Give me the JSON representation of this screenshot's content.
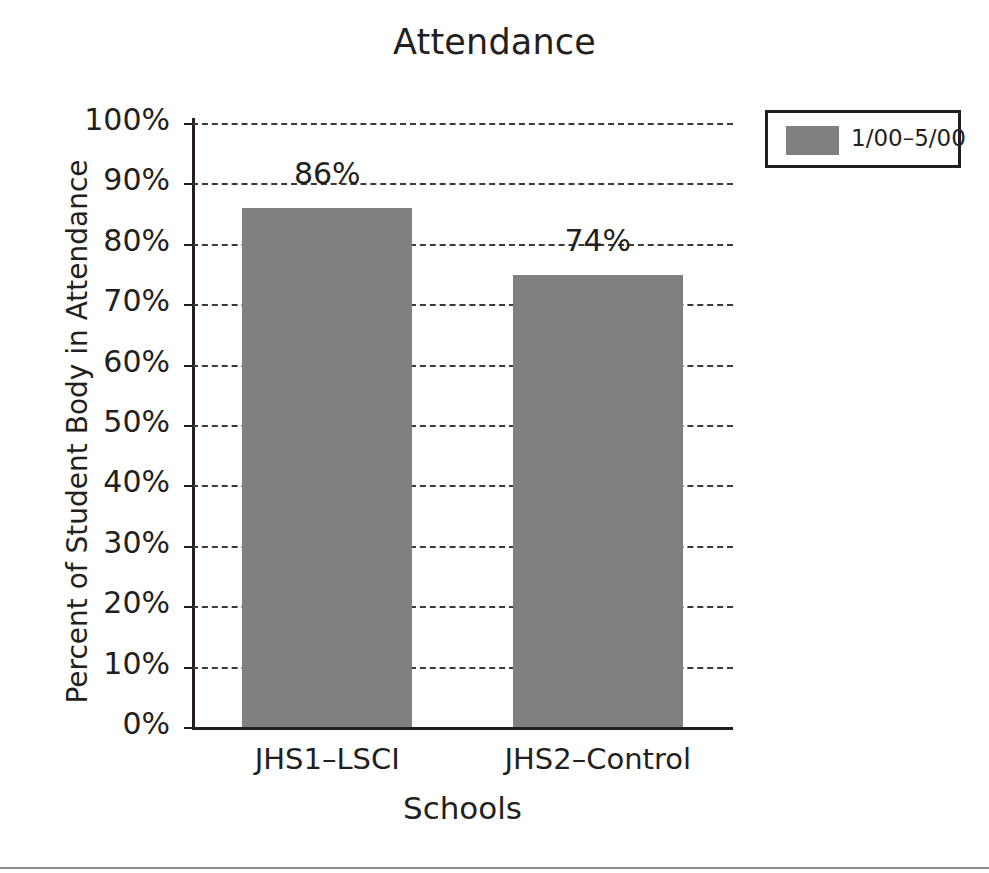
{
  "chart_data": {
    "type": "bar",
    "title": "Attendance",
    "xlabel": "Schools",
    "ylabel": "Percent of Student Body in Attendance",
    "categories": [
      "JHS1–LSCI",
      "JHS2–Control"
    ],
    "values": [
      86,
      74
    ],
    "bar_pixel_values": [
      85.9,
      74.8
    ],
    "data_labels": [
      "86%",
      "74%"
    ],
    "ylim": [
      0,
      100
    ],
    "ytick_values": [
      0,
      10,
      20,
      30,
      40,
      50,
      60,
      70,
      80,
      90,
      100
    ],
    "ytick_labels": [
      "0%",
      "10%",
      "20%",
      "30%",
      "40%",
      "50%",
      "60%",
      "70%",
      "80%",
      "90%",
      "100%"
    ],
    "grid": "horizontal-dashed",
    "legend_position": "top-right",
    "series": [
      {
        "name": "1/00–5/00",
        "values": [
          86,
          74
        ],
        "color": "#808080"
      }
    ],
    "legend": [
      {
        "label": "1/00–5/00",
        "color": "#808080"
      }
    ],
    "colors": {
      "bar": "#808080",
      "axis": "#231f20",
      "grid": "#3a3a3a",
      "text": "#231f20",
      "background": "#ffffff",
      "rule": "#8d8d8d"
    }
  }
}
